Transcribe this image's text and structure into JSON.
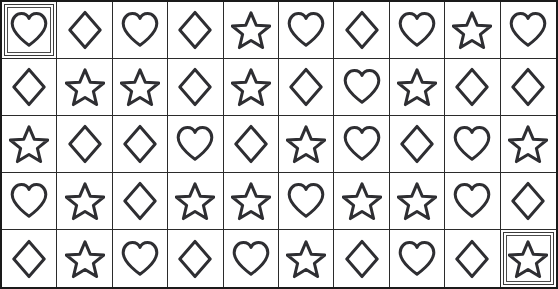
{
  "board": {
    "title": "Shape Grid",
    "columns": 10,
    "rows": 5,
    "shape_legend": {
      "heart": "heart-shape",
      "diamond": "diamond-shape",
      "star": "star-shape"
    },
    "colors": {
      "background": "#ffffff",
      "outer_border": "#1a1a1a",
      "cell_border": "#2b2b2b",
      "shape_stroke": "#2e2e32",
      "selection_border": "#3a3a3a"
    },
    "selected_cells": [
      {
        "row": 0,
        "col": 0,
        "shape": "heart"
      },
      {
        "row": 4,
        "col": 9,
        "shape": "star"
      }
    ],
    "grid": [
      [
        "heart",
        "diamond",
        "heart",
        "diamond",
        "star",
        "heart",
        "diamond",
        "heart",
        "star",
        "heart"
      ],
      [
        "diamond",
        "star",
        "star",
        "diamond",
        "star",
        "diamond",
        "heart",
        "star",
        "diamond",
        "diamond"
      ],
      [
        "star",
        "diamond",
        "diamond",
        "heart",
        "diamond",
        "star",
        "heart",
        "diamond",
        "heart",
        "star"
      ],
      [
        "heart",
        "star",
        "diamond",
        "star",
        "star",
        "heart",
        "star",
        "star",
        "heart",
        "diamond"
      ],
      [
        "diamond",
        "star",
        "heart",
        "diamond",
        "heart",
        "star",
        "diamond",
        "heart",
        "diamond",
        "star"
      ]
    ],
    "shape_counts": {
      "heart": 17,
      "diamond": 17,
      "star": 16
    }
  }
}
